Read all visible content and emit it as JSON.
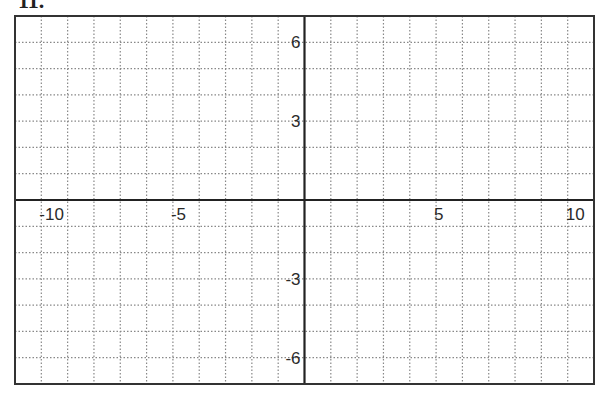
{
  "problem_label": "11.",
  "chart_data": {
    "type": "grid",
    "title": "",
    "xlabel": "",
    "ylabel": "",
    "xlim": [
      -11,
      11
    ],
    "ylim": [
      -7,
      7
    ],
    "grid": true,
    "grid_style": "dotted",
    "grid_step": 1,
    "x_tick_labels": [
      "-10",
      "-5",
      "5",
      "10"
    ],
    "x_tick_values": [
      -10,
      -5,
      5,
      10
    ],
    "y_tick_labels": [
      "6",
      "3",
      "-3",
      "-6"
    ],
    "y_tick_values": [
      6,
      3,
      -3,
      -6
    ],
    "series": []
  },
  "colors": {
    "axis": "#222222",
    "frame": "#333333",
    "grid": "#888888",
    "background": "#ffffff"
  }
}
